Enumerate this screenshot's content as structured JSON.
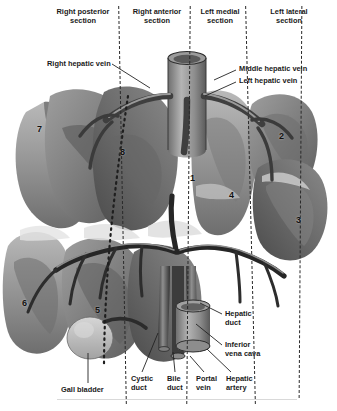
{
  "figure": {
    "type": "anatomical-diagram"
  },
  "section_headers": [
    {
      "id": "right-posterior",
      "label": "Right posterior\nsection",
      "x": 44,
      "y": 8,
      "w": 78
    },
    {
      "id": "right-anterior",
      "label": "Right anterior\nsection",
      "x": 126,
      "y": 8,
      "w": 66
    },
    {
      "id": "left-medial",
      "label": "Left medial\nsection",
      "x": 196,
      "y": 8,
      "w": 60
    },
    {
      "id": "left-lateral",
      "label": "Left lateral\nsection",
      "x": 262,
      "y": 8,
      "w": 62
    }
  ],
  "dividers": [
    {
      "id": "divider-1",
      "x": 122,
      "top": 6,
      "height": 398
    },
    {
      "id": "divider-2",
      "x": 188,
      "top": 6,
      "height": 398
    },
    {
      "id": "divider-3",
      "x": 250,
      "top": 6,
      "height": 398
    },
    {
      "id": "divider-4",
      "x": 300,
      "top": 6,
      "height": 392
    }
  ],
  "callouts": [
    {
      "id": "right-hepatic-vein",
      "label": "Right hepatic vein",
      "x": 47,
      "y": 60,
      "align": "l"
    },
    {
      "id": "middle-hepatic-vein",
      "label": "Middle hepatic vein",
      "x": 239,
      "y": 66,
      "align": "l"
    },
    {
      "id": "left-hepatic-vein",
      "label": "Left hepatic vein",
      "x": 239,
      "y": 78,
      "align": "l"
    },
    {
      "id": "hepatic-duct",
      "label": "Hepatic\nduct",
      "x": 225,
      "y": 310,
      "align": "l"
    },
    {
      "id": "inferior-vena-cava",
      "label": "Inferior\nvena cava",
      "x": 225,
      "y": 341,
      "align": "l"
    },
    {
      "id": "gall-bladder",
      "label": "Gall bladder",
      "x": 61,
      "y": 386,
      "align": "l"
    },
    {
      "id": "cystic-duct",
      "label": "Cystic\nduct",
      "x": 131,
      "y": 375,
      "align": "l"
    },
    {
      "id": "bile-duct",
      "label": "Bile\nduct",
      "x": 167,
      "y": 375,
      "align": "l"
    },
    {
      "id": "portal-vein",
      "label": "Portal\nvein",
      "x": 196,
      "y": 375,
      "align": "l"
    },
    {
      "id": "hepatic-artery",
      "label": "Hepatic\nartery",
      "x": 226,
      "y": 375,
      "align": "l"
    }
  ],
  "segments": [
    {
      "id": "segment-1",
      "label": "1",
      "x": 190,
      "y": 173
    },
    {
      "id": "segment-2",
      "label": "2",
      "x": 279,
      "y": 131
    },
    {
      "id": "segment-3",
      "label": "3",
      "x": 296,
      "y": 215
    },
    {
      "id": "segment-4",
      "label": "4",
      "x": 229,
      "y": 190
    },
    {
      "id": "segment-5",
      "label": "5",
      "x": 95,
      "y": 305
    },
    {
      "id": "segment-6",
      "label": "6",
      "x": 22,
      "y": 298
    },
    {
      "id": "segment-7",
      "label": "7",
      "x": 37,
      "y": 124
    },
    {
      "id": "segment-8",
      "label": "8",
      "x": 120,
      "y": 147
    }
  ],
  "leaders": [
    {
      "id": "leader-right-hepatic-vein",
      "x1": 112,
      "y1": 64,
      "x2": 150,
      "y2": 88
    },
    {
      "id": "leader-middle-hepatic-vein",
      "x1": 236,
      "y1": 70,
      "x2": 214,
      "y2": 80
    },
    {
      "id": "leader-left-hepatic-vein",
      "x1": 236,
      "y1": 82,
      "x2": 205,
      "y2": 96
    },
    {
      "id": "leader-hepatic-duct",
      "x1": 222,
      "y1": 314,
      "x2": 200,
      "y2": 303
    },
    {
      "id": "leader-inferior-vena-cava",
      "x1": 222,
      "y1": 345,
      "x2": 196,
      "y2": 324
    },
    {
      "id": "leader-gall-bladder",
      "x1": 88,
      "y1": 383,
      "x2": 88,
      "y2": 353
    },
    {
      "id": "leader-cystic-duct",
      "x1": 142,
      "y1": 372,
      "x2": 158,
      "y2": 333
    },
    {
      "id": "leader-bile-duct",
      "x1": 175,
      "y1": 372,
      "x2": 173,
      "y2": 352
    },
    {
      "id": "leader-portal-vein",
      "x1": 204,
      "y1": 372,
      "x2": 190,
      "y2": 356
    },
    {
      "id": "leader-hepatic-artery",
      "x1": 231,
      "y1": 372,
      "x2": 207,
      "y2": 349
    }
  ],
  "colors": {
    "background": "#ffffff",
    "lobe_dark": "#4e4e4e",
    "lobe_mid": "#7d7d7d",
    "lobe_light": "#a8a8a8",
    "lobe_pale": "#c9c9c9",
    "vessel_dark": "#2b2b2b",
    "vessel_mid": "#565656",
    "cava_fill": "#8c8c8c",
    "text": "#1a1a1a",
    "divider": "#2a2a2a",
    "rule": "#d9d9d9"
  }
}
